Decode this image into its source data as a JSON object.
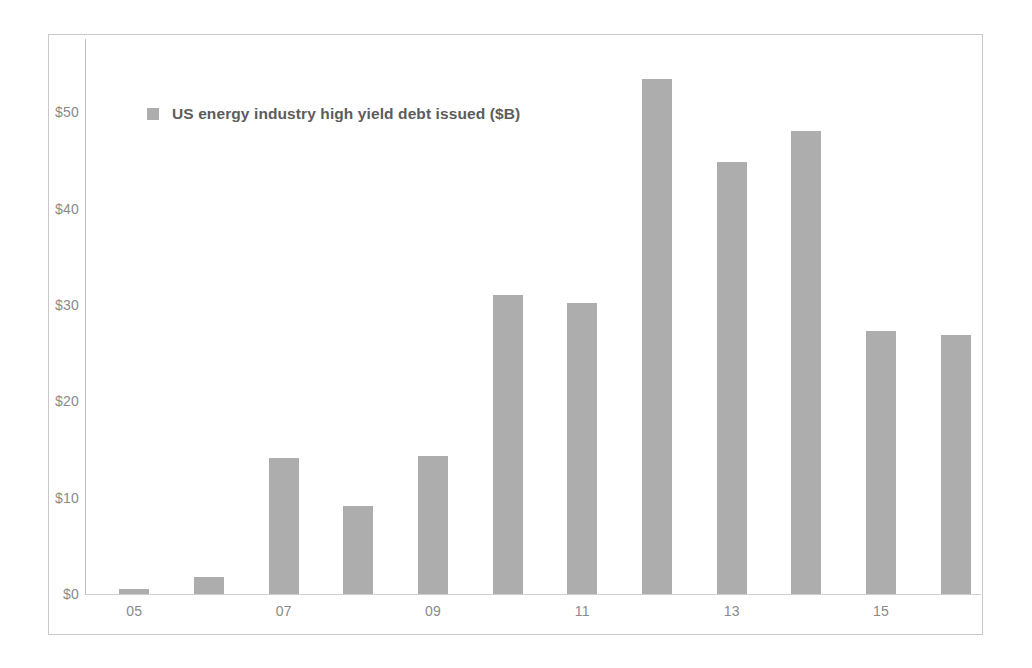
{
  "chart_data": {
    "type": "bar",
    "title": "",
    "subtitle": "",
    "xlabel": "",
    "ylabel": "",
    "legend": [
      {
        "label": "US energy industry high yield debt issued ($B)",
        "color": "#adadad"
      }
    ],
    "legend_position": "top-left-inside",
    "grid": false,
    "ylim": [
      0,
      55
    ],
    "y_ticks": [
      0,
      10,
      20,
      30,
      40,
      50
    ],
    "y_tick_labels": [
      "$0",
      "$10",
      "$20",
      "$30",
      "$40",
      "$50"
    ],
    "categories": [
      "05",
      "06",
      "07",
      "08",
      "09",
      "10",
      "11",
      "12",
      "13",
      "14",
      "15",
      "16"
    ],
    "x_tick_labels_shown": [
      "05",
      "07",
      "09",
      "11",
      "13",
      "15"
    ],
    "values": [
      0.5,
      1.8,
      14.1,
      9.1,
      14.3,
      31.0,
      30.2,
      53.4,
      44.8,
      48.0,
      27.3,
      26.9
    ],
    "value_unit": "$B",
    "bar_color": "#adadad",
    "axis_color": "#bdbdbd",
    "tick_text_color": "#8a8a8a",
    "frame_color": "#c9c9c9",
    "background": "#ffffff"
  }
}
